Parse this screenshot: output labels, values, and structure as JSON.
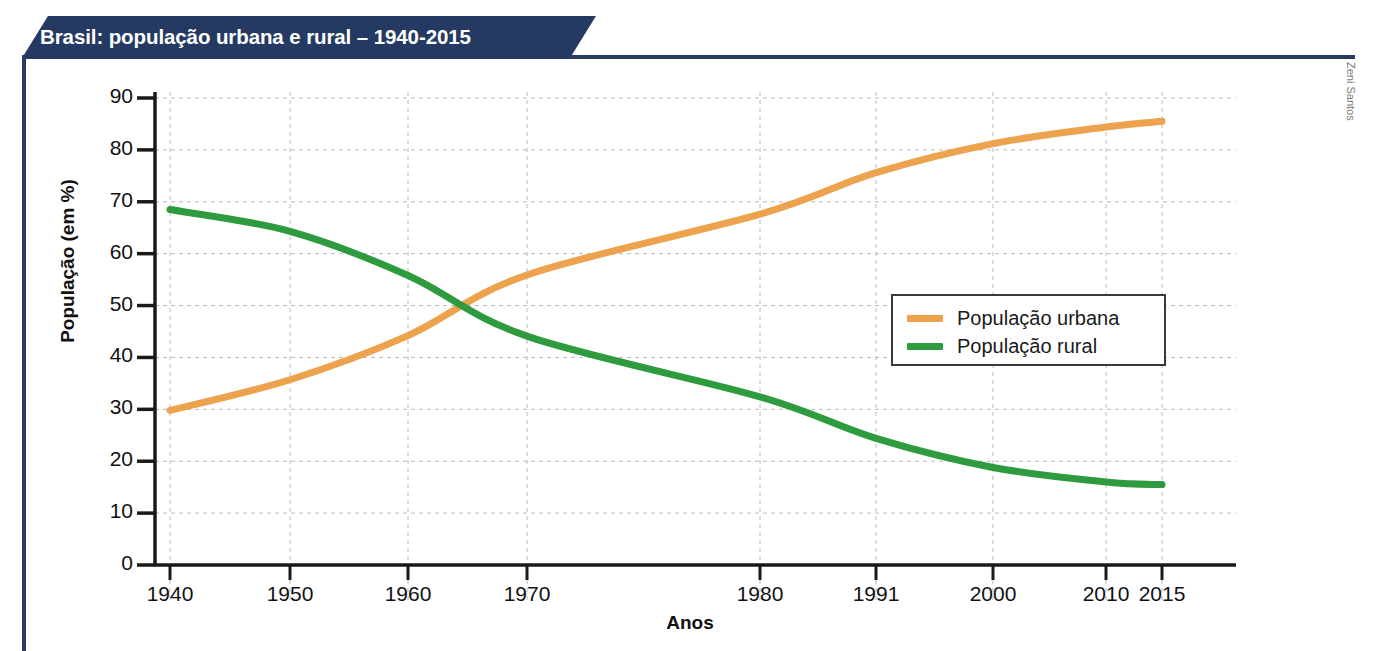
{
  "figure": {
    "title": "Brasil: população urbana e rural – 1940-2015",
    "credit": "Zeni Santos",
    "banner_color": "#243a63",
    "frame_color": "#2b3a60"
  },
  "chart_data": {
    "type": "line",
    "title": "Brasil: população urbana e rural – 1940-2015",
    "xlabel": "Anos",
    "ylabel": "População (em %)",
    "xlim": [
      1940,
      2015
    ],
    "ylim": [
      0,
      90
    ],
    "grid": true,
    "legend_position": "center-right",
    "x": [
      1940,
      1950,
      1960,
      1970,
      1980,
      1991,
      2000,
      2010,
      2015
    ],
    "xtick_labels": [
      "1940",
      "1950",
      "1960",
      "1970",
      "1980",
      "1991",
      "2000",
      "2010",
      "2015"
    ],
    "ytick_labels": [
      "0",
      "10",
      "20",
      "30",
      "40",
      "50",
      "60",
      "70",
      "80",
      "90"
    ],
    "ytick_values": [
      0,
      10,
      20,
      30,
      40,
      50,
      60,
      70,
      80,
      90
    ],
    "series": [
      {
        "name": "População urbana",
        "color": "#eda24d",
        "values": [
          29.8,
          35.7,
          44.2,
          55.9,
          67.6,
          75.6,
          81.2,
          84.4,
          85.5
        ]
      },
      {
        "name": "População rural",
        "color": "#2f9b3f",
        "values": [
          68.5,
          64.3,
          55.8,
          44.1,
          32.4,
          24.4,
          18.8,
          16.0,
          15.5
        ]
      }
    ],
    "annotations": [
      "As curvas se cruzam em aproximadamente 1965, em 50%."
    ]
  },
  "legend": {
    "items": [
      {
        "label": "População urbana",
        "color": "#eda24d"
      },
      {
        "label": "População rural",
        "color": "#2f9b3f"
      }
    ]
  }
}
